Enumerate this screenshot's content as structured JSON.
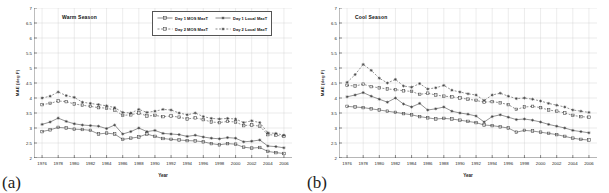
{
  "figure": {
    "panels": [
      {
        "tag": "(a)",
        "season_title": "Warm Season",
        "show_legend": true
      },
      {
        "tag": "(b)",
        "season_title": "Cool Season",
        "show_legend": false
      }
    ],
    "legend": {
      "entries": [
        {
          "label": "Day 1 MOS MaxT",
          "marker": "square",
          "dash": "solid"
        },
        {
          "label": "Day 1 Local MaxT",
          "marker": "cross",
          "dash": "solid"
        },
        {
          "label": "Day 2 MOS MaxT",
          "marker": "square",
          "dash": "dashed"
        },
        {
          "label": "Day 2 Local MaxT",
          "marker": "cross",
          "dash": "dashed"
        }
      ]
    }
  },
  "chart_data": [
    {
      "type": "line",
      "title": "Warm Season",
      "xlabel": "Year",
      "ylabel": "MAE (deg F)",
      "xlim": [
        1975,
        2007
      ],
      "ylim": [
        2,
        7
      ],
      "ytick_labels": [
        "2",
        "2.5",
        "3",
        "3.5",
        "4",
        "4.5",
        "5",
        "5.5",
        "6",
        "6.5",
        "7"
      ],
      "ytick_values": [
        2,
        2.5,
        3,
        3.5,
        4,
        4.5,
        5,
        5.5,
        6,
        6.5,
        7
      ],
      "xtick_labels": [
        "1976",
        "1978",
        "1980",
        "1982",
        "1984",
        "1986",
        "1988",
        "1990",
        "1992",
        "1994",
        "1996",
        "1998",
        "2000",
        "2002",
        "2004",
        "2006"
      ],
      "xtick_values": [
        1976,
        1978,
        1980,
        1982,
        1984,
        1986,
        1988,
        1990,
        1992,
        1994,
        1996,
        1998,
        2000,
        2002,
        2004,
        2006
      ],
      "grid": true,
      "legend_position": "top-right",
      "x": [
        1976,
        1977,
        1978,
        1979,
        1980,
        1981,
        1982,
        1983,
        1984,
        1985,
        1986,
        1987,
        1988,
        1989,
        1990,
        1991,
        1992,
        1993,
        1994,
        1995,
        1996,
        1997,
        1998,
        1999,
        2000,
        2001,
        2002,
        2003,
        2004,
        2005,
        2006
      ],
      "series": [
        {
          "name": "Day 1 MOS MaxT",
          "values": [
            2.88,
            2.94,
            3.02,
            3.0,
            2.96,
            2.95,
            2.92,
            2.8,
            2.83,
            2.8,
            2.62,
            2.66,
            2.7,
            2.8,
            2.72,
            2.65,
            2.62,
            2.6,
            2.58,
            2.57,
            2.54,
            2.48,
            2.44,
            2.48,
            2.46,
            2.36,
            2.33,
            2.35,
            2.22,
            2.18,
            2.15
          ]
        },
        {
          "name": "Day 1 Local MaxT",
          "values": [
            3.12,
            3.2,
            3.33,
            3.22,
            3.14,
            3.1,
            3.08,
            3.06,
            2.98,
            3.1,
            2.8,
            2.88,
            3.0,
            2.88,
            2.92,
            2.82,
            2.8,
            2.78,
            2.72,
            2.76,
            2.7,
            2.66,
            2.64,
            2.68,
            2.66,
            2.54,
            2.56,
            2.6,
            2.4,
            2.38,
            2.34
          ]
        },
        {
          "name": "Day 2 MOS MaxT",
          "values": [
            3.78,
            3.82,
            3.9,
            3.88,
            3.8,
            3.76,
            3.72,
            3.68,
            3.66,
            3.6,
            3.42,
            3.44,
            3.5,
            3.4,
            3.42,
            3.38,
            3.4,
            3.36,
            3.3,
            3.34,
            3.28,
            3.2,
            3.18,
            3.22,
            3.2,
            3.08,
            3.1,
            3.06,
            2.78,
            2.76,
            2.72
          ]
        },
        {
          "name": "Day 2 Local MaxT",
          "values": [
            4.0,
            4.06,
            4.2,
            4.08,
            4.02,
            3.86,
            3.82,
            3.78,
            3.74,
            3.68,
            3.52,
            3.5,
            3.62,
            3.52,
            3.56,
            3.62,
            3.6,
            3.5,
            3.44,
            3.5,
            3.38,
            3.32,
            3.3,
            3.32,
            3.3,
            3.18,
            3.24,
            3.18,
            2.84,
            2.82,
            2.76
          ]
        }
      ]
    },
    {
      "type": "line",
      "title": "Cool Season",
      "xlabel": "Year",
      "ylabel": "MAE (deg F)",
      "xlim": [
        1975,
        2007
      ],
      "ylim": [
        2,
        7
      ],
      "ytick_labels": [
        "2",
        "2.5",
        "3",
        "3.5",
        "4",
        "4.5",
        "5",
        "5.5",
        "6",
        "6.5",
        "7"
      ],
      "ytick_values": [
        2,
        2.5,
        3,
        3.5,
        4,
        4.5,
        5,
        5.5,
        6,
        6.5,
        7
      ],
      "xtick_labels": [
        "1976",
        "1978",
        "1980",
        "1982",
        "1984",
        "1986",
        "1988",
        "1990",
        "1992",
        "1994",
        "1996",
        "1998",
        "2000",
        "2002",
        "2004",
        "2006"
      ],
      "xtick_values": [
        1976,
        1978,
        1980,
        1982,
        1984,
        1986,
        1988,
        1990,
        1992,
        1994,
        1996,
        1998,
        2000,
        2002,
        2004,
        2006
      ],
      "grid": true,
      "legend_position": "none",
      "x": [
        1976,
        1977,
        1978,
        1979,
        1980,
        1981,
        1982,
        1983,
        1984,
        1985,
        1986,
        1987,
        1988,
        1989,
        1990,
        1991,
        1992,
        1993,
        1994,
        1995,
        1996,
        1997,
        1998,
        1999,
        2000,
        2001,
        2002,
        2003,
        2004,
        2005,
        2006
      ],
      "series": [
        {
          "name": "Day 1 MOS MaxT",
          "values": [
            3.72,
            3.7,
            3.68,
            3.64,
            3.6,
            3.56,
            3.52,
            3.48,
            3.44,
            3.38,
            3.34,
            3.3,
            3.32,
            3.3,
            3.26,
            3.22,
            3.18,
            3.1,
            3.08,
            3.04,
            3.0,
            2.86,
            2.92,
            2.9,
            2.86,
            2.82,
            2.78,
            2.72,
            2.66,
            2.62,
            2.6
          ]
        },
        {
          "name": "Day 1 Local MaxT",
          "values": [
            4.04,
            4.1,
            4.18,
            4.06,
            3.96,
            3.86,
            4.0,
            3.8,
            3.7,
            3.82,
            3.6,
            3.64,
            3.7,
            3.56,
            3.5,
            3.46,
            3.4,
            3.2,
            3.38,
            3.44,
            3.36,
            3.28,
            3.3,
            3.26,
            3.2,
            3.12,
            3.06,
            3.0,
            2.92,
            2.88,
            2.84
          ]
        },
        {
          "name": "Day 2 MOS MaxT",
          "values": [
            4.42,
            4.4,
            4.46,
            4.38,
            4.34,
            4.3,
            4.28,
            4.24,
            4.22,
            4.12,
            4.16,
            4.1,
            4.06,
            4.04,
            4.0,
            3.96,
            3.92,
            3.86,
            3.88,
            3.84,
            3.78,
            3.62,
            3.7,
            3.72,
            3.68,
            3.6,
            3.56,
            3.5,
            3.42,
            3.38,
            3.36
          ]
        },
        {
          "name": "Day 2 Local MaxT",
          "values": [
            4.52,
            4.78,
            5.12,
            4.92,
            4.66,
            4.5,
            4.62,
            4.4,
            4.36,
            4.48,
            4.3,
            4.34,
            4.42,
            4.26,
            4.2,
            4.14,
            4.1,
            3.92,
            4.1,
            4.16,
            4.06,
            3.98,
            4.0,
            3.96,
            3.9,
            3.82,
            3.76,
            3.7,
            3.6,
            3.56,
            3.52
          ]
        }
      ]
    }
  ]
}
